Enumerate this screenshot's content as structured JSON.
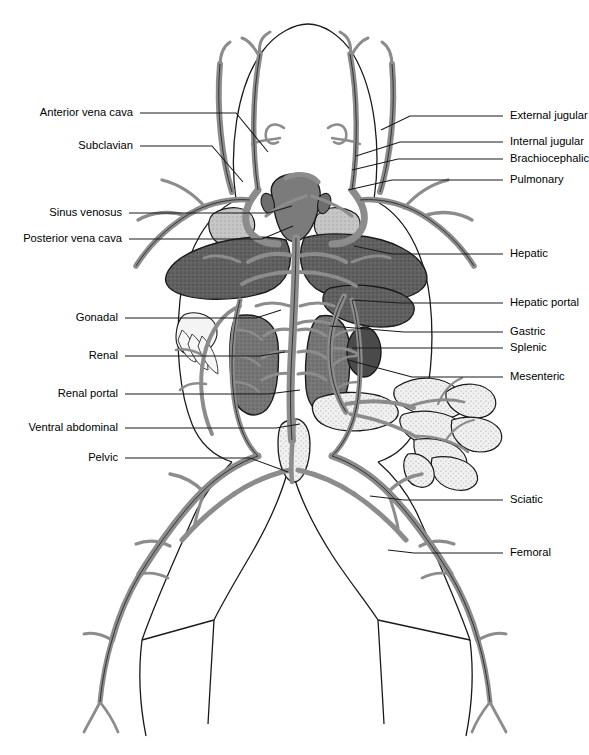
{
  "figure": {
    "view": "ventral",
    "colors": {
      "outline": "#1a1a1a",
      "vessel_fill": "#8c8c8c",
      "liver": "#5a5a5a",
      "kidney": "#6e6e6e",
      "spleen": "#4f4f4f",
      "heart": "#767676",
      "lung": "#b8b8b8",
      "intestine": "#ededed",
      "background": "#ffffff",
      "leader_line": "#1a1a1a"
    }
  },
  "labels_left": [
    {
      "id": "anterior-vena-cava",
      "text": "Anterior vena cava",
      "text_x": 133,
      "text_y": 113,
      "line": [
        [
          140,
          113
        ],
        [
          236,
          113
        ],
        [
          268,
          152
        ]
      ]
    },
    {
      "id": "subclavian",
      "text": "Subclavian",
      "text_x": 133,
      "text_y": 146,
      "line": [
        [
          140,
          146
        ],
        [
          212,
          146
        ],
        [
          243,
          182
        ]
      ]
    },
    {
      "id": "sinus-venosus",
      "text": "Sinus venosus",
      "text_x": 122,
      "text_y": 213,
      "line": [
        [
          129,
          213
        ],
        [
          268,
          213
        ],
        [
          292,
          206
        ]
      ]
    },
    {
      "id": "posterior-vena-cava",
      "text": "Posterior vena cava",
      "text_x": 122,
      "text_y": 239,
      "line": [
        [
          129,
          239
        ],
        [
          262,
          239
        ],
        [
          293,
          226
        ]
      ]
    },
    {
      "id": "gonadal",
      "text": "Gonadal",
      "text_x": 118,
      "text_y": 318,
      "line": [
        [
          125,
          318
        ],
        [
          256,
          318
        ],
        [
          281,
          310
        ]
      ]
    },
    {
      "id": "renal",
      "text": "Renal",
      "text_x": 118,
      "text_y": 356,
      "line": [
        [
          125,
          356
        ],
        [
          260,
          356
        ],
        [
          285,
          352
        ]
      ]
    },
    {
      "id": "renal-portal",
      "text": "Renal portal",
      "text_x": 118,
      "text_y": 394,
      "line": [
        [
          125,
          394
        ],
        [
          268,
          394
        ],
        [
          300,
          390
        ]
      ]
    },
    {
      "id": "ventral-abdominal",
      "text": "Ventral abdominal",
      "text_x": 118,
      "text_y": 428,
      "line": [
        [
          125,
          428
        ],
        [
          276,
          428
        ],
        [
          300,
          424
        ]
      ]
    },
    {
      "id": "pelvic",
      "text": "Pelvic",
      "text_x": 118,
      "text_y": 458,
      "line": [
        [
          125,
          458
        ],
        [
          250,
          458
        ],
        [
          288,
          472
        ]
      ]
    }
  ],
  "labels_right": [
    {
      "id": "external-jugular",
      "text": "External jugular",
      "text_x": 510,
      "text_y": 116,
      "line": [
        [
          503,
          116
        ],
        [
          410,
          116
        ],
        [
          381,
          130
        ]
      ]
    },
    {
      "id": "internal-jugular",
      "text": "Internal jugular",
      "text_x": 510,
      "text_y": 142,
      "line": [
        [
          503,
          142
        ],
        [
          400,
          142
        ],
        [
          356,
          156
        ]
      ]
    },
    {
      "id": "brachiocephalic",
      "text": "Brachiocephalic",
      "text_x": 510,
      "text_y": 159,
      "line": [
        [
          503,
          159
        ],
        [
          398,
          159
        ],
        [
          352,
          170
        ]
      ]
    },
    {
      "id": "pulmonary",
      "text": "Pulmonary",
      "text_x": 510,
      "text_y": 180,
      "line": [
        [
          503,
          180
        ],
        [
          392,
          180
        ],
        [
          348,
          190
        ]
      ]
    },
    {
      "id": "hepatic",
      "text": "Hepatic",
      "text_x": 510,
      "text_y": 254,
      "line": [
        [
          503,
          254
        ],
        [
          392,
          254
        ],
        [
          354,
          246
        ]
      ]
    },
    {
      "id": "hepatic-portal",
      "text": "Hepatic portal",
      "text_x": 510,
      "text_y": 303,
      "line": [
        [
          503,
          303
        ],
        [
          400,
          303
        ],
        [
          352,
          300
        ]
      ]
    },
    {
      "id": "gastric",
      "text": "Gastric",
      "text_x": 510,
      "text_y": 332,
      "line": [
        [
          503,
          332
        ],
        [
          404,
          332
        ],
        [
          330,
          326
        ]
      ]
    },
    {
      "id": "splenic",
      "text": "Splenic",
      "text_x": 510,
      "text_y": 348,
      "line": [
        [
          503,
          348
        ],
        [
          400,
          348
        ],
        [
          352,
          348
        ]
      ]
    },
    {
      "id": "mesenteric",
      "text": "Mesenteric",
      "text_x": 510,
      "text_y": 377,
      "line": [
        [
          503,
          377
        ],
        [
          412,
          377
        ],
        [
          348,
          360
        ]
      ]
    },
    {
      "id": "sciatic",
      "text": "Sciatic",
      "text_x": 510,
      "text_y": 500,
      "line": [
        [
          503,
          500
        ],
        [
          404,
          500
        ],
        [
          370,
          496
        ]
      ]
    },
    {
      "id": "femoral",
      "text": "Femoral",
      "text_x": 510,
      "text_y": 553,
      "line": [
        [
          503,
          553
        ],
        [
          414,
          553
        ],
        [
          388,
          550
        ]
      ]
    }
  ],
  "structures": [
    {
      "name": "head-outline",
      "kind": "body"
    },
    {
      "name": "trunk-outline",
      "kind": "body"
    },
    {
      "name": "left-leg-outline",
      "kind": "body"
    },
    {
      "name": "right-leg-outline",
      "kind": "body"
    },
    {
      "name": "heart",
      "kind": "organ"
    },
    {
      "name": "liver-left-lobe",
      "kind": "organ"
    },
    {
      "name": "liver-right-lobe",
      "kind": "organ"
    },
    {
      "name": "lung-left",
      "kind": "organ"
    },
    {
      "name": "lung-right",
      "kind": "organ"
    },
    {
      "name": "kidney-left",
      "kind": "organ"
    },
    {
      "name": "kidney-right",
      "kind": "organ"
    },
    {
      "name": "spleen",
      "kind": "organ"
    },
    {
      "name": "stomach",
      "kind": "organ"
    },
    {
      "name": "small-intestine",
      "kind": "organ"
    },
    {
      "name": "urinary-bladder",
      "kind": "organ"
    },
    {
      "name": "fat-body",
      "kind": "organ"
    }
  ]
}
